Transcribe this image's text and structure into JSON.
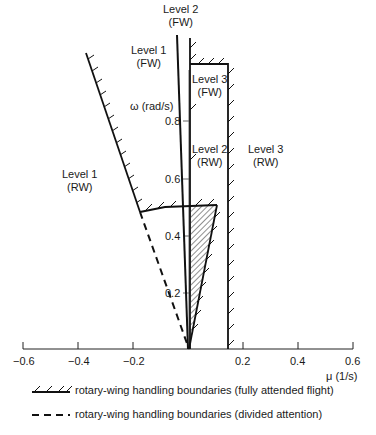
{
  "diagram": {
    "x_axis": {
      "label": "μ (1/s)",
      "ticks": [
        "−0.6",
        "−0.4",
        "−0.2",
        "0.2",
        "0.4",
        "0.6"
      ]
    },
    "y_axis": {
      "label": "ω (rad/s)",
      "ticks": [
        "0.8",
        "0.6",
        "0.4",
        "0.2"
      ]
    },
    "regions": {
      "level2_fw": {
        "line1": "Level 2",
        "line2": "(FW)"
      },
      "level1_fw": {
        "line1": "Level 1",
        "line2": "(FW)"
      },
      "level3_fw": {
        "line1": "Level 3",
        "line2": "(FW)"
      },
      "level2_rw": {
        "line1": "Level 2",
        "line2": "(RW)"
      },
      "level3_rw": {
        "line1": "Level 3",
        "line2": "(RW)"
      },
      "level1_rw": {
        "line1": "Level 1",
        "line2": "(RW)"
      }
    },
    "legend": [
      {
        "style": "hatched-solid",
        "text": "rotary-wing handling boundaries (fully attended flight)"
      },
      {
        "style": "dashed",
        "text": "rotary-wing handling boundaries (divided attention)"
      }
    ]
  }
}
